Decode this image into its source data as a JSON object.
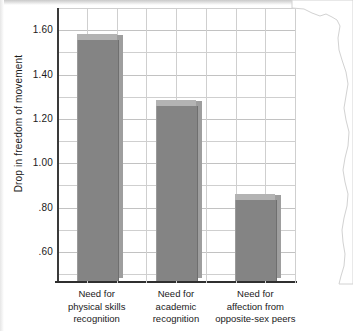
{
  "chart_data": {
    "type": "bar",
    "title": "",
    "xlabel": "",
    "ylabel": "Drop in freedom of movement",
    "categories": [
      "Need for physical skills recognition",
      "Need for academic recognition",
      "Need for affection from opposite-sex peers"
    ],
    "category_lines": [
      [
        "Need for",
        "physical skills",
        "recognition"
      ],
      [
        "Need for",
        "academic",
        "recognition"
      ],
      [
        "Need for",
        "affection from",
        "opposite-sex peers"
      ]
    ],
    "values": [
      1.57,
      1.27,
      0.85
    ],
    "ylim": [
      0.46,
      1.7
    ],
    "ytick_labels": [
      "1.60",
      "1.40",
      "1.20",
      "1.00",
      ".80",
      ".60"
    ],
    "ytick_values": [
      1.6,
      1.4,
      1.2,
      1.0,
      0.8,
      0.6
    ],
    "minor_tick_values": [
      1.7,
      1.5,
      1.3,
      1.1,
      0.9,
      0.7,
      0.5
    ],
    "grid": true,
    "legend": "none",
    "style": {
      "bar_face_color": "#848484",
      "bar_top_color": "#b3b3b3",
      "bar_side_color": "#9e9e9e",
      "gridline_color": "#cfcfcf",
      "axis_color": "#2f2f2f",
      "background": "#ffffff"
    }
  }
}
